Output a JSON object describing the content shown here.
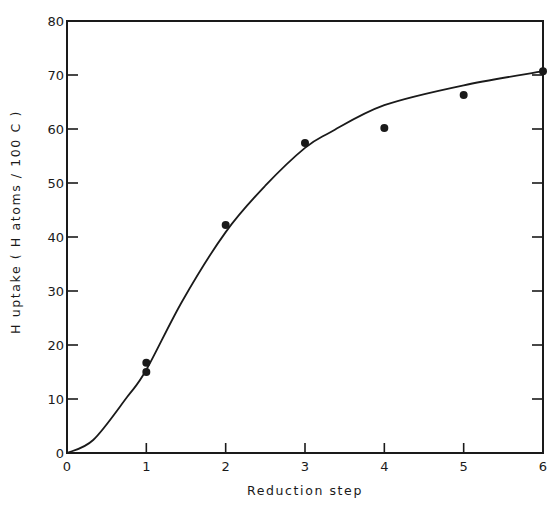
{
  "chart_data": {
    "type": "scatter",
    "title": "",
    "xlabel": "Reduction  step",
    "ylabel": "H uptake   ( H atoms / 100 C )",
    "xlim": [
      0,
      6
    ],
    "ylim": [
      0,
      80
    ],
    "x_ticks": [
      0,
      1,
      2,
      3,
      4,
      5,
      6
    ],
    "y_ticks": [
      0,
      10,
      20,
      30,
      40,
      50,
      60,
      70,
      80
    ],
    "grid": false,
    "legend": null,
    "series": [
      {
        "name": "measured",
        "kind": "scatter",
        "marker": "filled-circle",
        "points": [
          {
            "x": 1,
            "y": 16.7
          },
          {
            "x": 1,
            "y": 15.0
          },
          {
            "x": 2,
            "y": 42.2
          },
          {
            "x": 3,
            "y": 57.4
          },
          {
            "x": 4,
            "y": 60.2
          },
          {
            "x": 5,
            "y": 66.3
          },
          {
            "x": 6,
            "y": 70.7
          }
        ]
      },
      {
        "name": "fitted curve",
        "kind": "line",
        "points": [
          {
            "x": 0,
            "y": 0
          },
          {
            "x": 0.33,
            "y": 2.4
          },
          {
            "x": 0.76,
            "y": 10.4
          },
          {
            "x": 1,
            "y": 15.4
          },
          {
            "x": 1.46,
            "y": 28.3
          },
          {
            "x": 2,
            "y": 40.9
          },
          {
            "x": 2.5,
            "y": 49.5
          },
          {
            "x": 3,
            "y": 56.5
          },
          {
            "x": 3.32,
            "y": 59.4
          },
          {
            "x": 4,
            "y": 64.4
          },
          {
            "x": 5,
            "y": 68.1
          },
          {
            "x": 6,
            "y": 70.7
          }
        ]
      }
    ]
  },
  "style": {
    "ink_color": "#1a1a1a",
    "background": "#ffffff"
  }
}
